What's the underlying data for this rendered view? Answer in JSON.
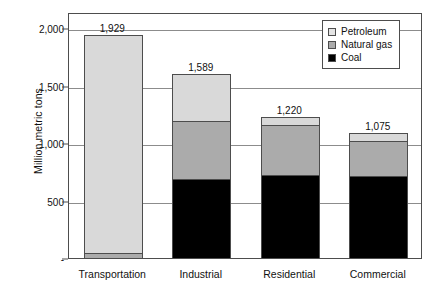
{
  "chart_data": {
    "type": "bar",
    "stacked": true,
    "title": "",
    "xlabel": "",
    "ylabel": "Million metric tons",
    "ylim": [
      0,
      2000
    ],
    "grid": true,
    "legend_position": "top-right",
    "categories": [
      "Transportation",
      "Industrial",
      "Residential",
      "Commercial"
    ],
    "ytick_labels": [
      "2,000",
      "1,500",
      "1,000",
      "500",
      "-"
    ],
    "ytick_values": [
      2000,
      1500,
      1000,
      500,
      0
    ],
    "series": [
      {
        "name": "Coal",
        "color": "#000000",
        "values": [
          0,
          690,
          725,
          710
        ]
      },
      {
        "name": "Natural gas",
        "color": "#ababab",
        "values": [
          40,
          505,
          430,
          310
        ]
      },
      {
        "name": "Petroleum",
        "color": "#d9d9d9",
        "values": [
          1889,
          394,
          65,
          55
        ]
      }
    ],
    "totals": [
      1929,
      1589,
      1220,
      1075
    ],
    "total_labels": [
      "1,929",
      "1,589",
      "1,220",
      "1,075"
    ]
  },
  "legend": {
    "items": [
      {
        "label": "Petroleum",
        "swatch": "petroleum-swatch"
      },
      {
        "label": "Natural gas",
        "swatch": "natural-gas-swatch"
      },
      {
        "label": "Coal",
        "swatch": "coal-swatch"
      }
    ]
  },
  "axis": {
    "y_title": "Million metric tons"
  }
}
